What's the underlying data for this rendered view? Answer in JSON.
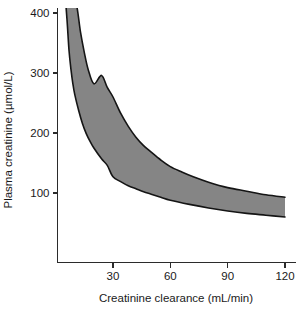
{
  "chart_data": {
    "type": "area",
    "title": "",
    "subtitle": "",
    "xlabel": "Creatinine clearance (mL/min)",
    "ylabel": "Plasma creatinine (µmol/L)",
    "xlim": [
      0,
      125
    ],
    "ylim": [
      0,
      420
    ],
    "xticks": [
      30,
      60,
      90,
      120
    ],
    "xtick_labels": [
      "30",
      "60",
      "90",
      "120"
    ],
    "yticks": [
      100,
      200,
      300,
      400
    ],
    "ytick_labels": [
      "100",
      "200",
      "300",
      "400"
    ],
    "grid": false,
    "legend": "none",
    "annotations": [],
    "band_color": "#858585",
    "edge_color": "#151515",
    "axis_color": "#2b2b2b",
    "background": "#ffffff",
    "x": [
      8,
      10,
      12,
      14,
      16,
      18,
      20,
      24,
      28,
      30,
      35,
      40,
      45,
      50,
      55,
      60,
      70,
      80,
      90,
      100,
      110,
      120
    ],
    "series": [
      {
        "name": "Upper bound",
        "values": [
          420,
          420,
          410,
          372,
          334,
          305,
          282,
          320,
          272,
          260,
          228,
          203,
          184,
          168,
          155,
          144,
          128,
          117,
          108,
          102,
          97,
          93
        ]
      },
      {
        "name": "Lower bound",
        "values": [
          318,
          268,
          236,
          211,
          192,
          177,
          165,
          146,
          132,
          127,
          117,
          110,
          103,
          97,
          92,
          88,
          81,
          75,
          70,
          66,
          63,
          60
        ]
      }
    ],
    "upper_points": [
      [
        7.6,
        420
      ],
      [
        9,
        420
      ],
      [
        11,
        412
      ],
      [
        13,
        368
      ],
      [
        15,
        334
      ],
      [
        17,
        306
      ],
      [
        20,
        282
      ],
      [
        24,
        296
      ],
      [
        27,
        276
      ],
      [
        30,
        260
      ],
      [
        34,
        233
      ],
      [
        38,
        211
      ],
      [
        42,
        193
      ],
      [
        46,
        179
      ],
      [
        50,
        168
      ],
      [
        55,
        155
      ],
      [
        60,
        144
      ],
      [
        66,
        135
      ],
      [
        72,
        127
      ],
      [
        80,
        118
      ],
      [
        90,
        109
      ],
      [
        100,
        103
      ],
      [
        110,
        97
      ],
      [
        120,
        93
      ]
    ],
    "lower_points": [
      [
        5.2,
        420
      ],
      [
        6,
        386
      ],
      [
        7,
        337
      ],
      [
        8,
        306
      ],
      [
        9,
        282
      ],
      [
        10,
        264
      ],
      [
        12,
        238
      ],
      [
        14,
        216
      ],
      [
        16,
        199
      ],
      [
        18,
        186
      ],
      [
        20,
        175
      ],
      [
        24,
        157
      ],
      [
        27,
        146
      ],
      [
        30,
        127
      ],
      [
        34,
        119
      ],
      [
        38,
        112
      ],
      [
        42,
        107
      ],
      [
        46,
        102
      ],
      [
        50,
        98
      ],
      [
        55,
        93
      ],
      [
        60,
        88
      ],
      [
        70,
        81
      ],
      [
        80,
        75
      ],
      [
        90,
        70
      ],
      [
        100,
        66
      ],
      [
        110,
        63
      ],
      [
        120,
        60
      ]
    ]
  },
  "axes": {
    "y_axis_name": "y-axis",
    "x_axis_name": "x-axis"
  }
}
